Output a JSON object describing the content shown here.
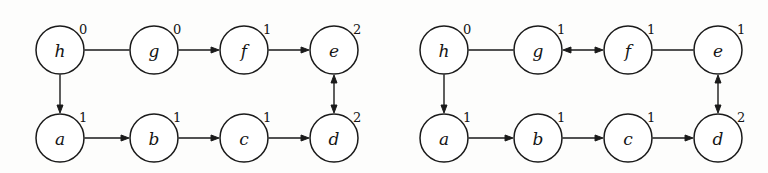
{
  "figure": {
    "title": "",
    "panels": [
      {
        "id": "left",
        "name": "left-graph",
        "nodes": [
          {
            "id": "h",
            "letter": "h",
            "number": "0",
            "cx": 60,
            "cy": 50,
            "r": 24,
            "label_dx": 19,
            "label_dy": -21
          },
          {
            "id": "g",
            "letter": "g",
            "number": "0",
            "cx": 154,
            "cy": 50,
            "r": 24,
            "label_dx": 19,
            "label_dy": -21
          },
          {
            "id": "f",
            "letter": "f",
            "number": "1",
            "cx": 244,
            "cy": 50,
            "r": 24,
            "label_dx": 19,
            "label_dy": -21
          },
          {
            "id": "e",
            "letter": "e",
            "number": "2",
            "cx": 334,
            "cy": 50,
            "r": 24,
            "label_dx": 19,
            "label_dy": -21
          },
          {
            "id": "a",
            "letter": "a",
            "number": "1",
            "cx": 60,
            "cy": 138,
            "r": 24,
            "label_dx": 19,
            "label_dy": -21
          },
          {
            "id": "b",
            "letter": "b",
            "number": "1",
            "cx": 154,
            "cy": 138,
            "r": 24,
            "label_dx": 19,
            "label_dy": -21
          },
          {
            "id": "c",
            "letter": "c",
            "number": "1",
            "cx": 244,
            "cy": 138,
            "r": 24,
            "label_dx": 19,
            "label_dy": -21
          },
          {
            "id": "d",
            "letter": "d",
            "number": "2",
            "cx": 334,
            "cy": 138,
            "r": 24,
            "label_dx": 19,
            "label_dy": -21
          }
        ],
        "edges": [
          {
            "from": "h",
            "to": "g",
            "style": "plain",
            "dir": "horizontal"
          },
          {
            "from": "g",
            "to": "f",
            "style": "arrow-forward",
            "dir": "horizontal"
          },
          {
            "from": "f",
            "to": "e",
            "style": "arrow-forward",
            "dir": "horizontal"
          },
          {
            "from": "h",
            "to": "a",
            "style": "arrow-forward",
            "dir": "vertical"
          },
          {
            "from": "a",
            "to": "b",
            "style": "arrow-forward",
            "dir": "horizontal"
          },
          {
            "from": "b",
            "to": "c",
            "style": "arrow-forward",
            "dir": "horizontal"
          },
          {
            "from": "c",
            "to": "d",
            "style": "arrow-forward",
            "dir": "horizontal"
          },
          {
            "from": "d",
            "to": "e",
            "style": "arrow-both",
            "dir": "vertical"
          }
        ]
      },
      {
        "id": "right",
        "name": "right-graph",
        "nodes": [
          {
            "id": "h",
            "letter": "h",
            "number": "0",
            "cx": 60,
            "cy": 50,
            "r": 24,
            "label_dx": 19,
            "label_dy": -21
          },
          {
            "id": "g",
            "letter": "g",
            "number": "1",
            "cx": 154,
            "cy": 50,
            "r": 24,
            "label_dx": 19,
            "label_dy": -21
          },
          {
            "id": "f",
            "letter": "f",
            "number": "1",
            "cx": 244,
            "cy": 50,
            "r": 24,
            "label_dx": 19,
            "label_dy": -21
          },
          {
            "id": "e",
            "letter": "e",
            "number": "1",
            "cx": 334,
            "cy": 50,
            "r": 24,
            "label_dx": 19,
            "label_dy": -21
          },
          {
            "id": "a",
            "letter": "a",
            "number": "1",
            "cx": 60,
            "cy": 138,
            "r": 24,
            "label_dx": 19,
            "label_dy": -21
          },
          {
            "id": "b",
            "letter": "b",
            "number": "1",
            "cx": 154,
            "cy": 138,
            "r": 24,
            "label_dx": 19,
            "label_dy": -21
          },
          {
            "id": "c",
            "letter": "c",
            "number": "1",
            "cx": 244,
            "cy": 138,
            "r": 24,
            "label_dx": 19,
            "label_dy": -21
          },
          {
            "id": "d",
            "letter": "d",
            "number": "2",
            "cx": 334,
            "cy": 138,
            "r": 24,
            "label_dx": 19,
            "label_dy": -21
          }
        ],
        "edges": [
          {
            "from": "h",
            "to": "g",
            "style": "plain",
            "dir": "horizontal"
          },
          {
            "from": "g",
            "to": "f",
            "style": "arrow-both",
            "dir": "horizontal"
          },
          {
            "from": "f",
            "to": "e",
            "style": "plain",
            "dir": "horizontal"
          },
          {
            "from": "h",
            "to": "a",
            "style": "arrow-forward",
            "dir": "vertical"
          },
          {
            "from": "a",
            "to": "b",
            "style": "arrow-forward",
            "dir": "horizontal"
          },
          {
            "from": "b",
            "to": "c",
            "style": "arrow-forward",
            "dir": "horizontal"
          },
          {
            "from": "c",
            "to": "d",
            "style": "arrow-forward",
            "dir": "horizontal"
          },
          {
            "from": "d",
            "to": "e",
            "style": "arrow-both",
            "dir": "vertical"
          }
        ]
      }
    ],
    "colors": {
      "stroke": "#1a1a1a",
      "node_fill": "#ffffff",
      "text": "#141414",
      "background": "#fdfdfc"
    }
  }
}
